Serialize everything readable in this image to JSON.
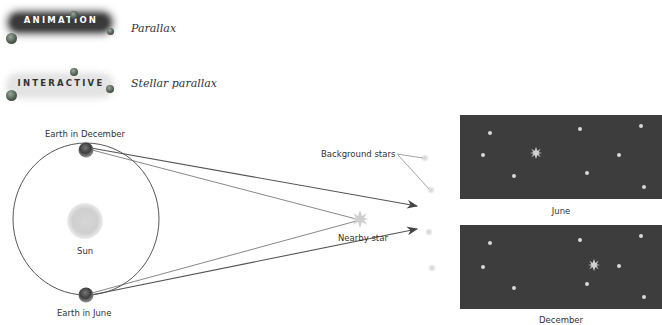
{
  "links": [
    {
      "badge": "ANIMATION",
      "title": "Parallax"
    },
    {
      "badge": "INTERACTIVE",
      "title": "Stellar parallax"
    }
  ],
  "diagram": {
    "labels": {
      "earth_december": "Earth in December",
      "earth_june": "Earth in June",
      "sun": "Sun",
      "background_stars": "Background stars",
      "nearby_star": "Nearby star"
    },
    "panels": [
      {
        "caption": "June"
      },
      {
        "caption": "December"
      }
    ]
  }
}
